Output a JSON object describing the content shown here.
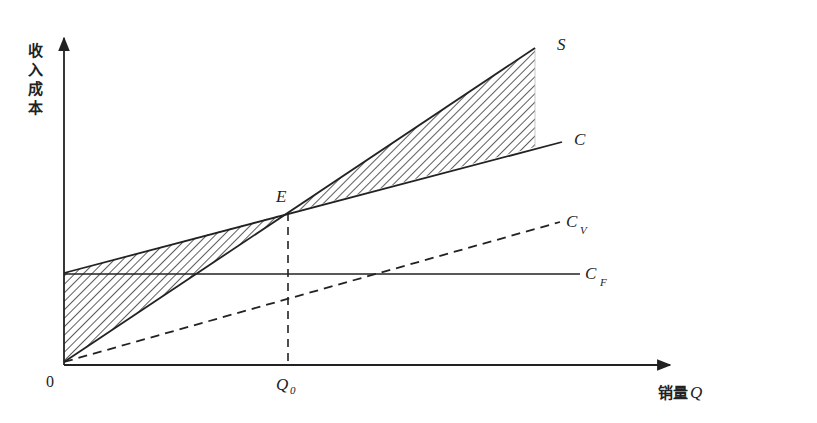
{
  "diagram": {
    "y_axis_label": [
      "收",
      "入",
      "成",
      "本"
    ],
    "x_axis_label": "销量",
    "x_axis_symbol": "Q",
    "origin_label": "0",
    "breakeven_point_label": "E",
    "breakeven_quantity_label": "Q",
    "breakeven_quantity_sub": "0",
    "lines": {
      "revenue": {
        "label": "S",
        "sub": ""
      },
      "total_cost": {
        "label": "C",
        "sub": ""
      },
      "variable_cost": {
        "label": "C",
        "sub": "V"
      },
      "fixed_cost": {
        "label": "C",
        "sub": "F"
      }
    },
    "shaded_regions": [
      "loss-region-left-of-E",
      "profit-region-right-of-E"
    ],
    "colors": {
      "ink": "#222222",
      "background": "#ffffff"
    }
  }
}
